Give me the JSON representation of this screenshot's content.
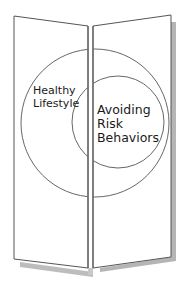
{
  "diagram": {
    "type": "trifold-brochure-venn",
    "outer_circle": {
      "label_lines": [
        "Healthy",
        "Lifestyle"
      ]
    },
    "inner_circle": {
      "label_lines": [
        "Avoiding",
        "Risk",
        "Behaviors"
      ]
    },
    "colors": {
      "background": "#ffffff",
      "panel_fill": "#ffffff",
      "line": "#555555",
      "shadow": "#b3b3b3",
      "text": "#1a1a1a"
    }
  }
}
